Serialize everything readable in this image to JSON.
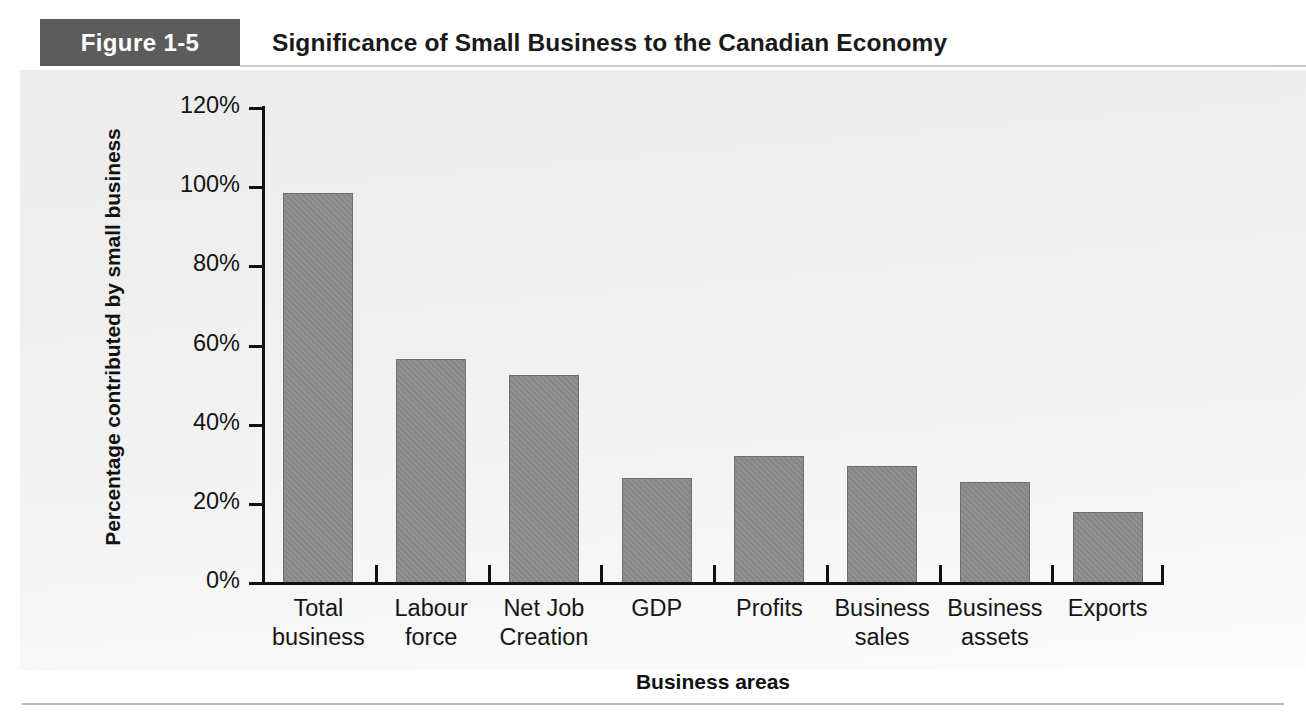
{
  "header": {
    "badge_label": "Figure 1-5",
    "title": "Significance of Small Business to the Canadian Economy",
    "badge_bg": "#5c5c5c",
    "badge_text_color": "#ffffff"
  },
  "chart_data": {
    "type": "bar",
    "title": "Significance of Small Business to the Canadian Economy",
    "xlabel": "Business areas",
    "ylabel": "Percentage contributed by small business",
    "categories": [
      "Total business",
      "Labour force",
      "Net Job Creation",
      "GDP",
      "Profits",
      "Business sales",
      "Business assets",
      "Exports"
    ],
    "category_lines": [
      [
        "Total",
        "business"
      ],
      [
        "Labour",
        "force"
      ],
      [
        "Net Job",
        "Creation"
      ],
      [
        "GDP",
        ""
      ],
      [
        "Profits",
        ""
      ],
      [
        "Business",
        "sales"
      ],
      [
        "Business",
        "assets"
      ],
      [
        "Exports",
        ""
      ]
    ],
    "values": [
      98.5,
      56.5,
      52.5,
      26.5,
      32,
      29.5,
      25.5,
      18
    ],
    "ylim": [
      0,
      120
    ],
    "ytick_values": [
      0,
      20,
      40,
      60,
      80,
      100,
      120
    ],
    "ytick_labels": [
      "0%",
      "20%",
      "40%",
      "60%",
      "80%",
      "100%",
      "120%"
    ],
    "grid": false,
    "legend": false,
    "bar_color": "#8b8b8b",
    "bar_edge_color": "#6f6f6f",
    "axis_color": "#111111",
    "plot_background": "#ececed"
  }
}
